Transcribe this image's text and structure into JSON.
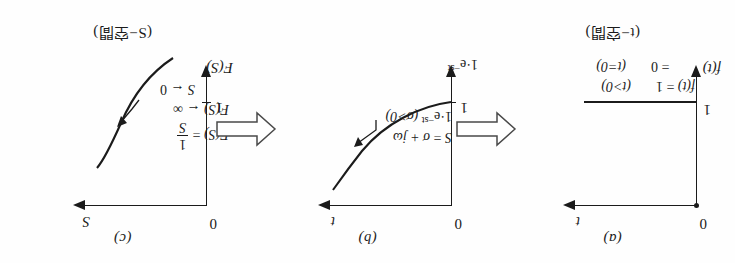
{
  "figure": {
    "orientation": "rotated-180",
    "ink_color": "#1b1b1b",
    "paper_color": "#fefefe"
  },
  "panels": [
    {
      "id": "a",
      "caption": "(a)",
      "domain_label": "(t−空間)",
      "h_axis_label": "t",
      "v_axis_label": "f(t)",
      "origin_label": "0",
      "tick_label": "1",
      "equations": [
        "f(t) = 1   (t>0)",
        "= 0   (t=0)"
      ],
      "eq_rows": [
        {
          "lhs": "f(t)",
          "rel": "=",
          "rhs": "1",
          "cond": "(t>0)"
        },
        {
          "lhs": "",
          "rel": "=",
          "rhs": "0",
          "cond": "(t=0)"
        }
      ],
      "curve_type": "unit-step-horizontal-line"
    },
    {
      "id": "b",
      "caption": "(b)",
      "domain_label": "",
      "h_axis_label": "t",
      "v_axis_label": "1·e⁻ˢᵗ",
      "v_axis_parts": {
        "base": "1·e",
        "exp": "−st"
      },
      "origin_label": "0",
      "tick_label": "1",
      "annotation_lines": [
        "S = σ + jω",
        "1·e⁻ˢᵗ (σ>0)"
      ],
      "annotation": {
        "line1": {
          "lhs": "S",
          "rel": "=",
          "rhs": "σ + jω"
        },
        "line2": {
          "expr": "1·e",
          "exp": "−st",
          "cond": "(σ>0)"
        }
      },
      "curve_type": "decaying-exponential"
    },
    {
      "id": "c",
      "caption": "(c)",
      "domain_label": "(S−空間)",
      "h_axis_label": "S",
      "v_axis_label": "F(S)",
      "origin_label": "0",
      "tick_label": "1",
      "annotation_lines": [
        "F(S) = 1/S",
        "F(S) → ∞",
        "S → 0"
      ],
      "annotation": {
        "line1": {
          "lhs": "F(S)",
          "rel": "=",
          "num": "1",
          "den": "S"
        },
        "line2": {
          "lhs": "F(S)",
          "arrow": "←",
          "rhs": "∞"
        },
        "line3": {
          "lhs": "S",
          "arrow": "←",
          "rhs": "0"
        }
      },
      "curve_type": "reciprocal-hyperbola"
    }
  ],
  "connectors": [
    {
      "id": "arrow-a-to-b",
      "shape": "hollow-block-arrow",
      "direction": "left"
    },
    {
      "id": "arrow-b-to-c",
      "shape": "hollow-block-arrow",
      "direction": "left"
    }
  ]
}
